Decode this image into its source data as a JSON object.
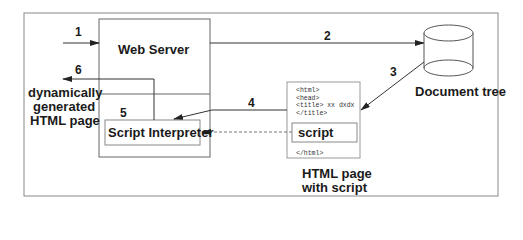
{
  "diagram": {
    "nodes": {
      "web_server": "Web Server",
      "script_interpreter": "Script Interpreter",
      "document_tree": "Document tree",
      "html_page": "HTML page\nwith script",
      "html_page_line1": "HTML page",
      "html_page_line2": "with script",
      "output_line1": "dynamically",
      "output_line2": "generated",
      "output_line3": "HTML page",
      "script_block": "script"
    },
    "html_code_lines": [
      "<html>",
      "<head>",
      "<title> xx dxdx",
      "</title>",
      "</html>"
    ],
    "steps": [
      "1",
      "2",
      "3",
      "4",
      "5",
      "6"
    ],
    "colors": {
      "line": "#444444",
      "border": "#888888",
      "text": "#1a1a1a"
    }
  }
}
